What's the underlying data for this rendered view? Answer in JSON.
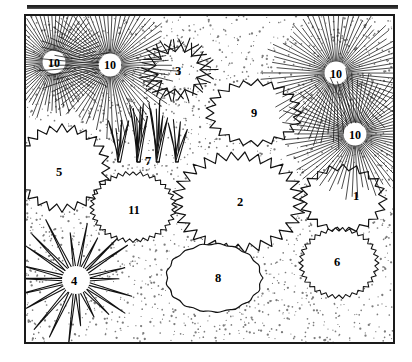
{
  "figure": {
    "background_color": "#ffffff",
    "ink_color": "#111111",
    "stipple_color": "#4a4a4a",
    "top_rule": {
      "name": "top-rule"
    },
    "frame": {
      "x": 24,
      "y": 14,
      "width": 371,
      "height": 330,
      "border_color": "#1a1a1a"
    }
  },
  "symbols": [
    {
      "id": 1,
      "label": "1",
      "kind": "jagged-blob",
      "x": 343,
      "y": 199,
      "rx": 38,
      "ry": 30
    },
    {
      "id": 2,
      "label": "2",
      "kind": "jagged-blob",
      "x": 238,
      "y": 202,
      "rx": 58,
      "ry": 44
    },
    {
      "id": 3,
      "label": "3",
      "kind": "chevron-burst",
      "x": 178,
      "y": 70,
      "rx": 34,
      "ry": 30
    },
    {
      "id": 4,
      "label": "4",
      "kind": "spiky-sun",
      "x": 76,
      "y": 280,
      "rx": 46,
      "ry": 44
    },
    {
      "id": 5,
      "label": "5",
      "kind": "jagged-blob",
      "x": 62,
      "y": 168,
      "rx": 42,
      "ry": 38
    },
    {
      "id": 6,
      "label": "6",
      "kind": "sawtooth-oval",
      "x": 339,
      "y": 263,
      "rx": 36,
      "ry": 32
    },
    {
      "id": 7,
      "label": "7",
      "kind": "grass-tufts",
      "x": 148,
      "y": 136,
      "rx": 40,
      "ry": 28
    },
    {
      "id": 8,
      "label": "8",
      "kind": "wavy-blob",
      "x": 214,
      "y": 278,
      "rx": 46,
      "ry": 33
    },
    {
      "id": 9,
      "label": "9",
      "kind": "jagged-blob",
      "x": 254,
      "y": 113,
      "rx": 42,
      "ry": 29
    },
    {
      "id": 10,
      "label": "10",
      "kind": "radial-starburst",
      "x": 54,
      "y": 62,
      "rx": 24,
      "ry": 24
    },
    {
      "id": 10,
      "label": "10",
      "kind": "radial-starburst",
      "x": 110,
      "y": 65,
      "rx": 30,
      "ry": 30
    },
    {
      "id": 10,
      "label": "10",
      "kind": "radial-starburst",
      "x": 336,
      "y": 73,
      "rx": 31,
      "ry": 31
    },
    {
      "id": 10,
      "label": "10",
      "kind": "radial-starburst",
      "x": 355,
      "y": 134,
      "rx": 31,
      "ry": 28
    },
    {
      "id": 11,
      "label": "11",
      "kind": "sawtooth-oval",
      "x": 133,
      "y": 207,
      "rx": 39,
      "ry": 32
    }
  ],
  "labels": [
    {
      "text": "10",
      "x": 54,
      "y": 63
    },
    {
      "text": "10",
      "x": 110,
      "y": 65
    },
    {
      "text": "3",
      "x": 178,
      "y": 71
    },
    {
      "text": "10",
      "x": 336,
      "y": 74
    },
    {
      "text": "9",
      "x": 254,
      "y": 113
    },
    {
      "text": "10",
      "x": 355,
      "y": 135
    },
    {
      "text": "7",
      "x": 148,
      "y": 161
    },
    {
      "text": "5",
      "x": 59,
      "y": 172
    },
    {
      "text": "1",
      "x": 356,
      "y": 196
    },
    {
      "text": "2",
      "x": 240,
      "y": 202
    },
    {
      "text": "11",
      "x": 134,
      "y": 210
    },
    {
      "text": "6",
      "x": 337,
      "y": 262
    },
    {
      "text": "8",
      "x": 218,
      "y": 278
    },
    {
      "text": "4",
      "x": 74,
      "y": 281
    }
  ]
}
